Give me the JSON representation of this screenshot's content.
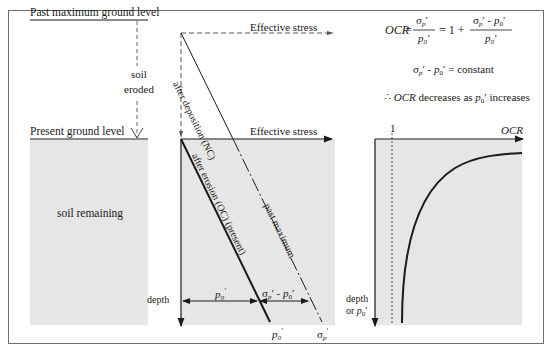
{
  "left_panel": {
    "past_level_label": "Past maximum ground level",
    "eroded_label_1": "soil",
    "eroded_label_2": "eroded",
    "present_level_label": "Present ground level",
    "soil_remaining_label": "soil remaining"
  },
  "middle_panel": {
    "top_axis_label": "Effective stress",
    "axis_label": "Effective stress",
    "nc_line_label": "after deposition (NC)",
    "oc_line_label": "after erosion (OC) (present)",
    "past_max_label": "past maximum",
    "depth_label": "depth",
    "p0_label": "p",
    "p0_sub": "0",
    "diff_label_sigma": "σ",
    "diff_label_sub_p": "p",
    "diff_label_mid": "′ - ",
    "bottom_p0": "p",
    "bottom_sigma": "σ"
  },
  "right_panel": {
    "formula_ocr": "OCR",
    "formula_eq1": "=",
    "formula_eq2": "= 1 +",
    "formula_constant": "= constant",
    "therefore": "∴",
    "conclusion_mid": "decreases as",
    "conclusion_end": "increases",
    "axis_one": "1",
    "axis_label": "OCR",
    "depth_label_1": "depth",
    "depth_label_2": "or"
  },
  "colors": {
    "soil_fill": "#e6e6e6",
    "line": "#1a1a1a",
    "frame": "#6e6e6e"
  }
}
